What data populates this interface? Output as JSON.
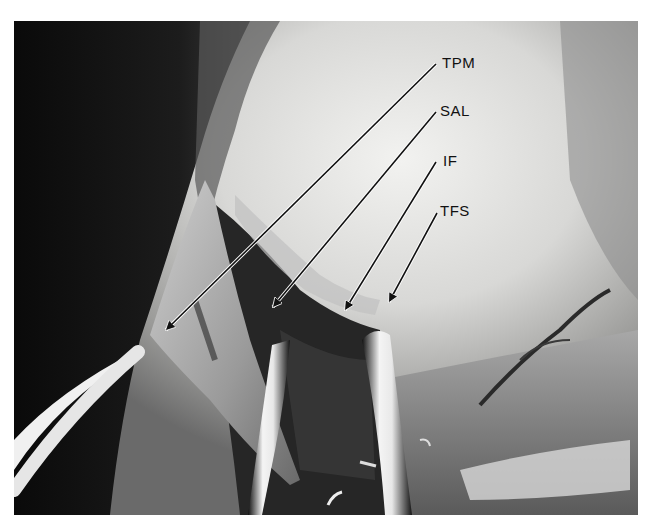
{
  "figure": {
    "type": "grayscale surgical photograph",
    "labels": [
      {
        "text": "TPM",
        "x": 442,
        "y": 55
      },
      {
        "text": "SAL",
        "x": 440,
        "y": 103
      },
      {
        "text": "IF",
        "x": 443,
        "y": 153
      },
      {
        "text": "TFS",
        "x": 440,
        "y": 203
      }
    ],
    "arrows": [
      {
        "label": "TPM",
        "from": [
          436,
          64
        ],
        "to": [
          163,
          333
        ]
      },
      {
        "label": "SAL",
        "from": [
          436,
          112
        ],
        "to": [
          270,
          310
        ]
      },
      {
        "label": "IF",
        "from": [
          436,
          162
        ],
        "to": [
          343,
          313
        ]
      },
      {
        "label": "TFS",
        "from": [
          437,
          213
        ],
        "to": [
          387,
          305
        ]
      }
    ]
  }
}
